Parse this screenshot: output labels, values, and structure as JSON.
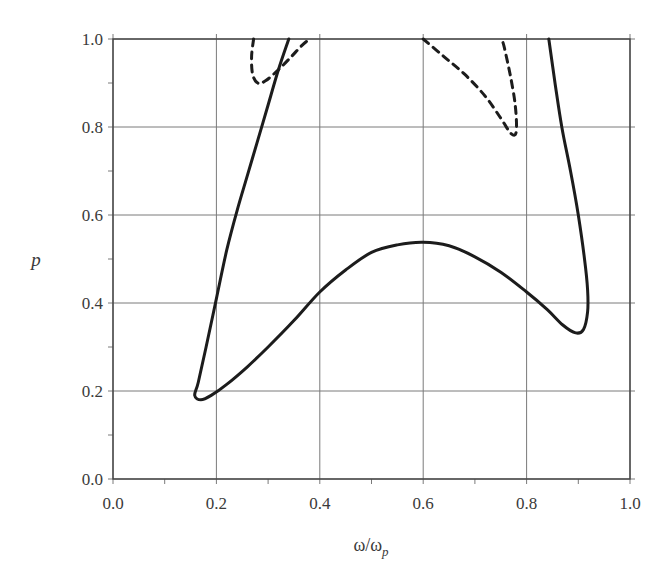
{
  "chart_data": {
    "type": "line",
    "title": "",
    "xlabel": "ω/ω",
    "xlabel_sub": "p",
    "ylabel": "p",
    "xlim": [
      0.0,
      1.0
    ],
    "ylim": [
      0.0,
      1.0
    ],
    "grid": true,
    "legend": null,
    "x_ticks": [
      "0.0",
      "0.2",
      "0.4",
      "0.6",
      "0.8",
      "1.0"
    ],
    "y_ticks": [
      "0.0",
      "0.2",
      "0.4",
      "0.6",
      "0.8",
      "1.0"
    ],
    "series": [
      {
        "name": "solid-boundary",
        "style": "solid",
        "points": [
          [
            0.34,
            1.0
          ],
          [
            0.32,
            0.93
          ],
          [
            0.3,
            0.85
          ],
          [
            0.28,
            0.77
          ],
          [
            0.26,
            0.69
          ],
          [
            0.24,
            0.61
          ],
          [
            0.22,
            0.52
          ],
          [
            0.2,
            0.41
          ],
          [
            0.18,
            0.3
          ],
          [
            0.165,
            0.22
          ],
          [
            0.158,
            0.19
          ],
          [
            0.17,
            0.18
          ],
          [
            0.19,
            0.19
          ],
          [
            0.22,
            0.215
          ],
          [
            0.26,
            0.255
          ],
          [
            0.3,
            0.3
          ],
          [
            0.35,
            0.36
          ],
          [
            0.4,
            0.425
          ],
          [
            0.45,
            0.475
          ],
          [
            0.5,
            0.515
          ],
          [
            0.55,
            0.532
          ],
          [
            0.6,
            0.538
          ],
          [
            0.65,
            0.53
          ],
          [
            0.7,
            0.505
          ],
          [
            0.75,
            0.47
          ],
          [
            0.8,
            0.425
          ],
          [
            0.84,
            0.385
          ],
          [
            0.87,
            0.35
          ],
          [
            0.895,
            0.332
          ],
          [
            0.91,
            0.34
          ],
          [
            0.918,
            0.38
          ],
          [
            0.918,
            0.43
          ],
          [
            0.912,
            0.5
          ],
          [
            0.9,
            0.6
          ],
          [
            0.885,
            0.7
          ],
          [
            0.868,
            0.8
          ],
          [
            0.855,
            0.9
          ],
          [
            0.843,
            1.0
          ]
        ]
      },
      {
        "name": "dashed-left",
        "style": "dashed",
        "points": [
          [
            0.272,
            1.0
          ],
          [
            0.268,
            0.96
          ],
          [
            0.27,
            0.92
          ],
          [
            0.28,
            0.9
          ],
          [
            0.295,
            0.905
          ],
          [
            0.32,
            0.93
          ],
          [
            0.345,
            0.96
          ],
          [
            0.365,
            0.985
          ],
          [
            0.38,
            1.0
          ]
        ]
      },
      {
        "name": "dashed-right",
        "style": "dashed",
        "points": [
          [
            0.6,
            1.0
          ],
          [
            0.64,
            0.96
          ],
          [
            0.68,
            0.92
          ],
          [
            0.72,
            0.87
          ],
          [
            0.75,
            0.82
          ],
          [
            0.77,
            0.785
          ],
          [
            0.78,
            0.79
          ],
          [
            0.778,
            0.85
          ],
          [
            0.768,
            0.92
          ],
          [
            0.757,
            0.98
          ],
          [
            0.752,
            1.0
          ]
        ]
      }
    ]
  },
  "plot": {
    "left": 113,
    "right": 630,
    "top": 39,
    "bottom": 479
  }
}
